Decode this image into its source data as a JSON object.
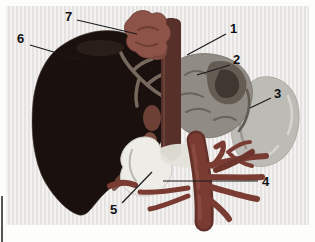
{
  "figure": {
    "type": "anatomical-illustration",
    "background_color": "#e9e8e6",
    "margin_color": "#fdfdfc",
    "callouts": [
      {
        "text": "1"
      },
      {
        "text": "2"
      },
      {
        "text": "3"
      },
      {
        "text": "4"
      },
      {
        "text": "5"
      },
      {
        "text": "6"
      },
      {
        "text": "7"
      }
    ],
    "palette": {
      "liver": "#1a100d",
      "liver_highlight": "#2c201b",
      "liver_edge": "#4a4038",
      "hepatic_vessels": "#77685e",
      "lower_liver_vessels": "#6e4a3c",
      "venous_confluence": "#8d5348",
      "confluence_shadow": "#6e3d35",
      "aorta": "#563029",
      "aorta_highlight": "#6f463b",
      "stomach": "#908b84",
      "stomach_mottle": "#5a5149",
      "stomach_swirl": "#403830",
      "stomach_lines": "#6b6258",
      "spleen": "#bdbbb5",
      "spleen_highlight": "#d6d4ce",
      "spleen_shadow": "#9a968e",
      "duodenum": "#edece6",
      "duodenum_band": "#e3e1d9",
      "duodenum_shade": "#b9b6ae",
      "portal_vessels": "#7a3b32",
      "portal_dark": "#64312a",
      "portal_light": "#8d4d42",
      "leader_line": "#1b1b1b",
      "label_text": "#111111"
    }
  }
}
